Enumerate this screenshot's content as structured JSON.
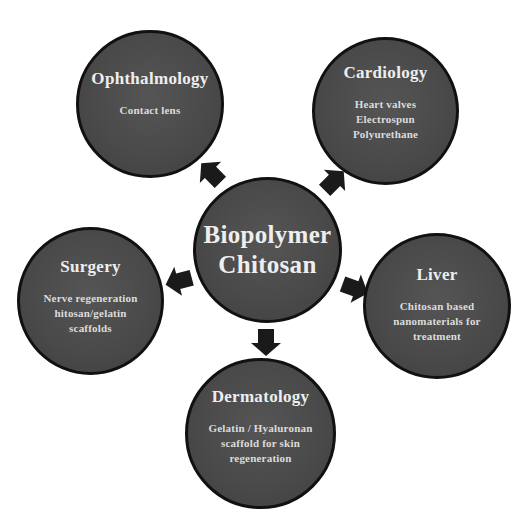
{
  "diagram": {
    "center": {
      "title_line1": "Biopolymer",
      "title_line2": "Chitosan"
    },
    "nodes": [
      {
        "id": "ophthalmology",
        "title": "Ophthalmology",
        "desc": [
          "Contact lens"
        ]
      },
      {
        "id": "cardiology",
        "title": "Cardiology",
        "desc": [
          "Heart valves",
          "Electrospun",
          "Polyurethane"
        ]
      },
      {
        "id": "surgery",
        "title": "Surgery",
        "desc": [
          "Nerve regeneration",
          "hitosan/gelatin",
          "scaffolds"
        ]
      },
      {
        "id": "liver",
        "title": "Liver",
        "desc": [
          "Chitosan based",
          "nanomaterials for",
          "treatment"
        ]
      },
      {
        "id": "dermatology",
        "title": "Dermatology",
        "desc": [
          "Gelatin / Hyaluronan",
          "scaffold for skin",
          "regeneration"
        ]
      }
    ],
    "colors": {
      "circle_fill": "#4a4a4a",
      "circle_border": "#111111",
      "arrow": "#1a1a1a",
      "text": "#e6e6e6",
      "background": "#ffffff"
    }
  }
}
